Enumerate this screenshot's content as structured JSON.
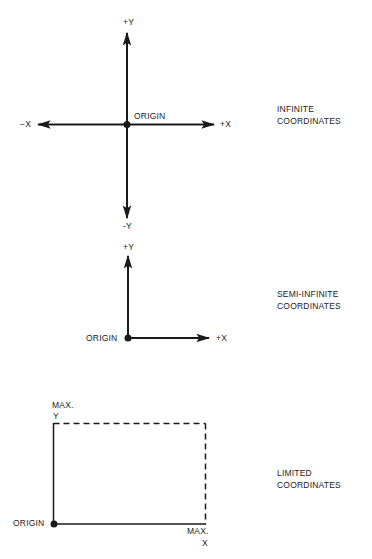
{
  "figure": {
    "panels": [
      {
        "id": "infinite",
        "caption": [
          "INFINITE",
          "COORDINATES"
        ],
        "labels": {
          "pos_y": "+Y",
          "neg_y": "-Y",
          "pos_x": "+X",
          "neg_x": "−X",
          "origin": "ORIGIN"
        }
      },
      {
        "id": "semi-infinite",
        "caption": [
          "SEMI-INFINITE",
          "COORDINATES"
        ],
        "labels": {
          "pos_y": "+Y",
          "pos_x": "+X",
          "origin": "ORIGIN"
        }
      },
      {
        "id": "limited",
        "caption": [
          "LIMITED",
          "COORDINATES"
        ],
        "labels": {
          "max_y_line1": "MAX.",
          "max_y_line2": "Y",
          "max_x_line1": "MAX.",
          "max_x_line2": "X",
          "origin": "ORIGIN"
        }
      }
    ]
  },
  "colors": {
    "ink": "#1a1a1a",
    "background": "#ffffff"
  }
}
